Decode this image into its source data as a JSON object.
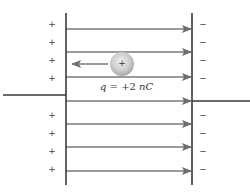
{
  "diagram": {
    "charge_label": "q = +2 nC",
    "charge_label_parts": {
      "symbol": "q",
      "equals": " = +2 ",
      "unit": "nC"
    },
    "charge_sign": "+",
    "left_plate": {
      "x": 66,
      "y_top": 13,
      "y_bottom": 185,
      "signs": [
        "+",
        "+",
        "+",
        "+",
        "+",
        "+",
        "+",
        "+"
      ]
    },
    "right_plate": {
      "x": 192,
      "y_top": 13,
      "y_bottom": 185,
      "signs": [
        "−",
        "−",
        "−",
        "−",
        "−",
        "−",
        "−",
        "−"
      ]
    },
    "sign_rows_y": [
      25,
      43,
      61,
      79,
      116,
      134,
      152,
      170
    ],
    "field_lines_y": [
      29,
      52,
      77,
      101,
      124,
      147,
      171
    ],
    "field_direction": "left-to-right",
    "force_arrow": {
      "direction": "left",
      "from_x": 108,
      "to_x": 72,
      "y": 64
    },
    "charge_sphere": {
      "cx": 122,
      "cy": 64,
      "r": 12
    },
    "left_wire": {
      "x1": 3,
      "x2": 66,
      "y": 95
    },
    "right_wire": {
      "x1": 192,
      "x2": 250,
      "y": 101
    },
    "colors": {
      "plate": "#3a3a3a",
      "field_line": "#7a7a7a",
      "arrowhead": "#6e6e6e",
      "sphere_center": "#e6e6e6",
      "sphere_edge": "#a8a8a8",
      "text": "#333333"
    }
  }
}
